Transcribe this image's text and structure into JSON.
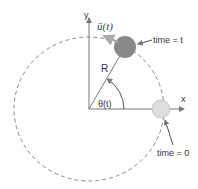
{
  "diagram": {
    "labels": {
      "y_axis": "y",
      "x_axis": "x",
      "radius": "R",
      "angle": "θ(t)",
      "velocity": "ū(t)",
      "time_t": "time = t",
      "time_0": "time = 0"
    },
    "colors": {
      "axis": "#777777",
      "circle": "#888888",
      "ball_t": "#888888",
      "ball_0": "#dddddd",
      "velocity_arrow": "#aaaaaa"
    }
  }
}
